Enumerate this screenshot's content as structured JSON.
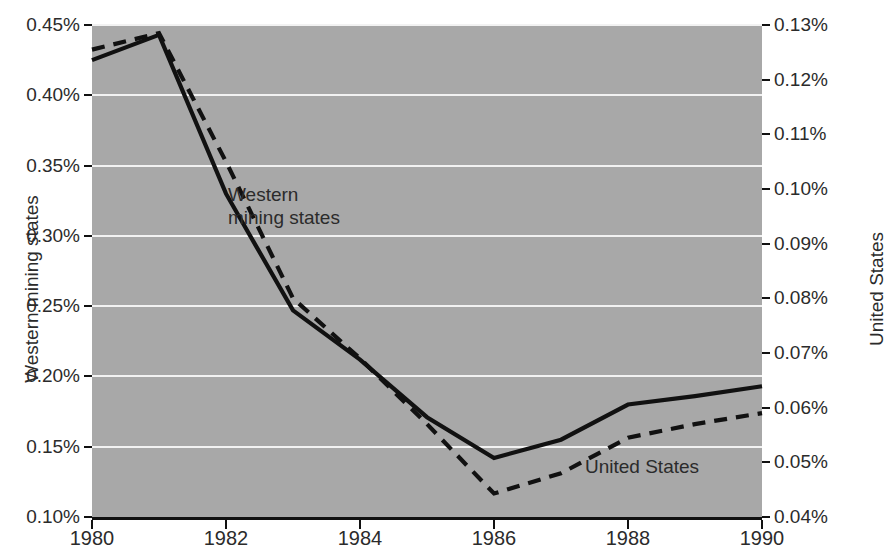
{
  "chart_data": {
    "type": "line",
    "title": "",
    "xlabel": "",
    "grid": "horizontal",
    "legend_position": "inline-annotations",
    "x": [
      1980,
      1981,
      1982,
      1983,
      1984,
      1985,
      1986,
      1987,
      1988,
      1989,
      1990
    ],
    "x_tick_labels": [
      "1980",
      "1982",
      "1984",
      "1986",
      "1988",
      "1990"
    ],
    "x_tick_values": [
      1980,
      1982,
      1984,
      1986,
      1988,
      1990
    ],
    "xlim": [
      1980,
      1990
    ],
    "axes": [
      {
        "id": "left",
        "label": "Western mining states",
        "ylim": [
          0.1,
          0.45
        ],
        "tick_values": [
          0.1,
          0.15,
          0.2,
          0.25,
          0.3,
          0.35,
          0.4,
          0.45
        ],
        "tick_labels": [
          "0.10%",
          "0.15%",
          "0.20%",
          "0.25%",
          "0.30%",
          "0.35%",
          "0.40%",
          "0.45%"
        ]
      },
      {
        "id": "right",
        "label": "United States",
        "ylim": [
          0.04,
          0.13
        ],
        "tick_values": [
          0.04,
          0.05,
          0.06,
          0.07,
          0.08,
          0.09,
          0.1,
          0.11,
          0.12,
          0.13
        ],
        "tick_labels": [
          "0.04%",
          "0.05%",
          "0.06%",
          "0.07%",
          "0.08%",
          "0.09%",
          "0.10%",
          "0.11%",
          "0.12%",
          "0.13%"
        ]
      }
    ],
    "series": [
      {
        "name": "Western mining states",
        "axis": "left",
        "style": "solid",
        "color": "#111111",
        "values": [
          0.425,
          0.443,
          0.33,
          0.247,
          0.212,
          0.171,
          0.142,
          0.155,
          0.18,
          0.186,
          0.193
        ]
      },
      {
        "name": "United States",
        "axis": "right",
        "style": "dashed",
        "color": "#111111",
        "values": [
          0.1255,
          0.1285,
          0.105,
          0.08,
          0.069,
          0.057,
          0.0443,
          0.048,
          0.0545,
          0.057,
          0.059
        ]
      }
    ],
    "annotations": [
      {
        "id": "western",
        "text": "Western\nmining states",
        "x": 1983.0,
        "y_left": 0.305
      },
      {
        "id": "united-states",
        "text": "United States",
        "x": 1988.2,
        "y_left": 0.148
      }
    ],
    "colors": {
      "plot_background": "#a8a8a8",
      "gridline": "#f2f2f2",
      "axis": "#111111",
      "page_background": "#ffffff",
      "text": "#2b2b2b"
    }
  }
}
